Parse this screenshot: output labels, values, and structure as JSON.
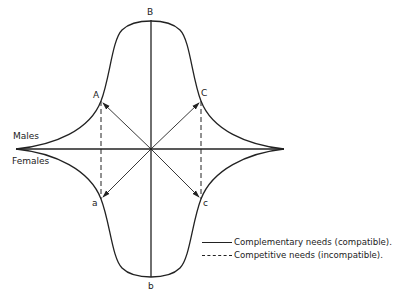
{
  "diagram": {
    "labels": {
      "B": "B",
      "b": "b",
      "A": "A",
      "C": "C",
      "a": "a",
      "c": "c",
      "males": "Males",
      "females": "Females"
    },
    "legend": [
      {
        "style": "solid",
        "label": "Complementary needs (compatible)."
      },
      {
        "style": "dashed",
        "label": "Competitive needs (incompatible)."
      }
    ],
    "colors": {
      "line": "#222222",
      "background": "#ffffff"
    }
  }
}
